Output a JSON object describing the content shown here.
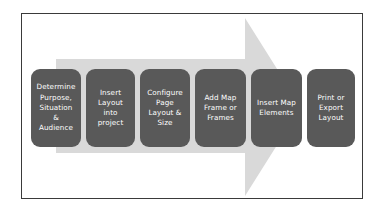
{
  "diagram": {
    "arrow": {
      "name": "right-pointing-process-arrow",
      "color": "#d9d9d9",
      "direction": "right"
    },
    "frame": {
      "border_color": "#3a3a3a",
      "background": "#ffffff"
    },
    "box_style": {
      "fill": "#595959",
      "text_color": "#ffffff"
    },
    "steps": [
      {
        "index": "1",
        "label": "Determine\nPurpose,\nSituation\n&\nAudience"
      },
      {
        "index": "2",
        "label": "Insert\nLayout\ninto\nproject"
      },
      {
        "index": "3",
        "label": "Configure\nPage\nLayout &\nSize"
      },
      {
        "index": "4",
        "label": "Add Map\nFrame or\nFrames"
      },
      {
        "index": "5",
        "label": "Insert Map\nElements"
      },
      {
        "index": "6",
        "label": "Print or\nExport\nLayout"
      }
    ]
  }
}
